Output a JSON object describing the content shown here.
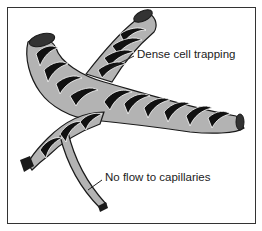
{
  "diagram": {
    "labels": {
      "trapping": "Dense cell trapping",
      "capillaries": "No flow to capillaries"
    },
    "colors": {
      "vessel_wall": "#b3b3b3",
      "cells": "#111111",
      "outline": "#1a1a1a",
      "frame": "#333333",
      "background": "#ffffff"
    }
  }
}
